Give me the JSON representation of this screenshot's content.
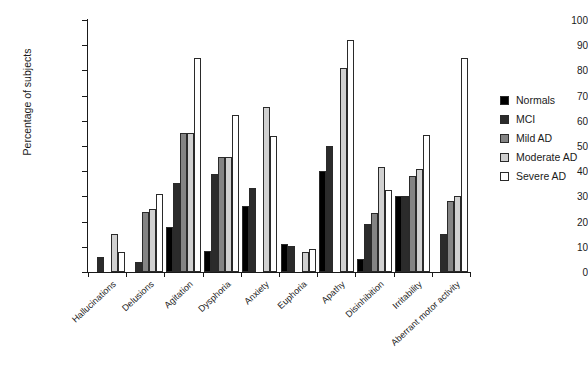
{
  "chart_data": {
    "type": "bar",
    "title": "",
    "xlabel": "",
    "ylabel": "Percentage of subjects",
    "ylim": [
      0,
      100
    ],
    "ytick_step": 10,
    "yticks": [
      0,
      10,
      20,
      30,
      40,
      50,
      60,
      70,
      80,
      90,
      100
    ],
    "grid": false,
    "legend_position": "right",
    "categories": [
      "Hallucinations",
      "Delusions",
      "Agitation",
      "Dysphoria",
      "Anxiety",
      "Euphoria",
      "Apathy",
      "Disinhibition",
      "Irritability",
      "Aberrant motor activity"
    ],
    "series": [
      {
        "name": "Normals",
        "color": "#000000",
        "values": [
          0,
          0,
          18,
          8.5,
          26,
          11,
          40,
          5,
          30,
          0
        ]
      },
      {
        "name": "MCI",
        "color": "#2b2b2b",
        "values": [
          6,
          4,
          35.5,
          39,
          33.5,
          10.5,
          50,
          19,
          30,
          15
        ]
      },
      {
        "name": "Mild AD",
        "color": "#848484",
        "values": [
          0,
          24,
          55,
          45.5,
          0,
          0,
          0,
          23.5,
          38,
          28
        ]
      },
      {
        "name": "Moderate AD",
        "color": "#d0d0d0",
        "values": [
          15,
          25,
          55,
          45.5,
          65.5,
          8,
          81,
          41.5,
          41,
          30
        ]
      },
      {
        "name": "Severe AD",
        "color": "#ffffff",
        "values": [
          8,
          31,
          85,
          62.5,
          54,
          9,
          92,
          32.5,
          54.5,
          85
        ]
      }
    ]
  },
  "legend": {
    "items": [
      {
        "label": "Normals",
        "color": "#000000"
      },
      {
        "label": "MCI",
        "color": "#2b2b2b"
      },
      {
        "label": "Mild AD",
        "color": "#848484"
      },
      {
        "label": "Moderate AD",
        "color": "#d0d0d0"
      },
      {
        "label": "Severe AD",
        "color": "#ffffff"
      }
    ]
  }
}
